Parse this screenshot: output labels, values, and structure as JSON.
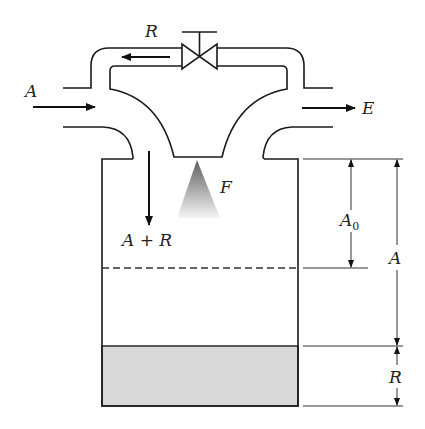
{
  "figure": {
    "type": "process-schematic"
  },
  "streams": {
    "inlet": {
      "label": "A"
    },
    "exit": {
      "label": "E"
    },
    "recycle": {
      "label": "R"
    },
    "tank_inflow": {
      "label": "A + R"
    },
    "feed_spray": {
      "label": "F"
    }
  },
  "dimensions": {
    "headspace": {
      "label": "A",
      "subscript": "0"
    },
    "air_zone": {
      "label": "A"
    },
    "liquid_zone": {
      "label": "R"
    }
  },
  "colors": {
    "line": "#1a1a1a",
    "liquid_fill": "#d9d9d9",
    "spray_top": "#6b6b6b",
    "spray_bottom": "#f2f2f2"
  }
}
